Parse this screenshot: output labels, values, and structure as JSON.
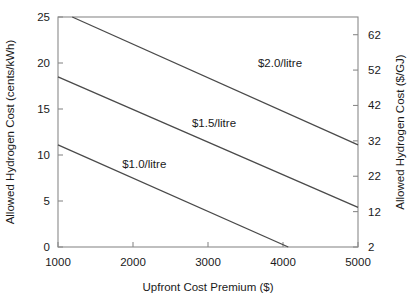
{
  "chart_data": {
    "type": "line",
    "title": "",
    "xlabel": "Upfront Cost Premium ($)",
    "ylabel": "Allowed Hydrogen Cost (cents/kWh)",
    "y2label": "Allowed Hydrogen Cost ($/GJ)",
    "xlim": [
      1000,
      5000
    ],
    "ylim": [
      0,
      25
    ],
    "y2lim": [
      2,
      67
    ],
    "grid": false,
    "legend_position": "inline-annotations",
    "xticks": [
      1000,
      2000,
      3000,
      4000,
      5000
    ],
    "xticklabels": [
      "1000",
      "2000",
      "3000",
      "4000",
      "5000"
    ],
    "yticks": [
      0,
      5,
      10,
      15,
      20,
      25
    ],
    "yticklabels": [
      "0",
      "5",
      "10",
      "15",
      "20",
      "25"
    ],
    "y2ticks": [
      2,
      12,
      22,
      32,
      42,
      52,
      62
    ],
    "y2ticklabels": [
      "2",
      "12",
      "22",
      "32",
      "42",
      "52",
      "62"
    ],
    "series": [
      {
        "name": "$1.0/litre",
        "label": "$1.0/litre",
        "color": "#4a4a4a",
        "x": [
          1000,
          4070
        ],
        "values": [
          11.1,
          0.0
        ],
        "label_x": 2150,
        "label_y": 8.6
      },
      {
        "name": "$1.5/litre",
        "label": "$1.5/litre",
        "color": "#4a4a4a",
        "x": [
          1000,
          5000
        ],
        "values": [
          18.5,
          4.3
        ],
        "label_x": 3080,
        "label_y": 13.0
      },
      {
        "name": "$2.0/litre",
        "label": "$2.0/litre",
        "color": "#4a4a4a",
        "x": [
          1190,
          5000
        ],
        "values": [
          25.0,
          11.1
        ],
        "label_x": 3960,
        "label_y": 19.6
      }
    ]
  },
  "axes": {
    "x_title": "Upfront Cost Premium ($)",
    "y_left_title": "Allowed Hydrogen Cost (cents/kWh)",
    "y_right_title": "Allowed Hydrogen Cost ($/GJ)"
  }
}
